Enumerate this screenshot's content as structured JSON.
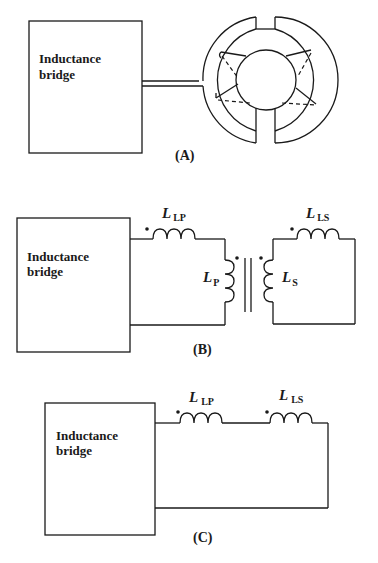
{
  "figure": {
    "panels": [
      {
        "id": "A",
        "label": "(A)",
        "bridge_label_line1": "Inductance",
        "bridge_label_line2": "bridge",
        "description": "Inductance bridge connected via twin lead to a split-ring coil setup"
      },
      {
        "id": "B",
        "label": "(B)",
        "bridge_label_line1": "Inductance",
        "bridge_label_line2": "bridge",
        "components": [
          {
            "symbol": "L",
            "subscript": "LP",
            "role": "primary leakage inductance"
          },
          {
            "symbol": "L",
            "subscript": "P",
            "role": "primary inductance"
          },
          {
            "symbol": "L",
            "subscript": "S",
            "role": "secondary inductance"
          },
          {
            "symbol": "L",
            "subscript": "LS",
            "role": "secondary leakage inductance"
          }
        ]
      },
      {
        "id": "C",
        "label": "(C)",
        "bridge_label_line1": "Inductance",
        "bridge_label_line2": "bridge",
        "components": [
          {
            "symbol": "L",
            "subscript": "LP",
            "role": "primary leakage inductance"
          },
          {
            "symbol": "L",
            "subscript": "LS",
            "role": "secondary leakage inductance"
          }
        ]
      }
    ]
  },
  "colors": {
    "line": "#1a1a1a",
    "background": "#ffffff"
  }
}
